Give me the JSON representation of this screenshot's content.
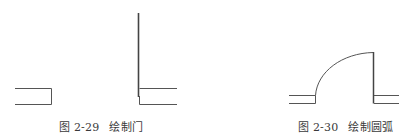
{
  "figures": [
    {
      "id": "left",
      "caption_number": "图 2-29",
      "caption_title": "绘制门",
      "description": "door line drawn between two wall openings"
    },
    {
      "id": "right",
      "caption_number": "图 2-30",
      "caption_title": "绘制圆弧",
      "description": "door with swing arc drawn"
    }
  ],
  "colors": {
    "line": "#555555",
    "door_line": "#444444",
    "caption_text": "#3a3a3a",
    "background": "#ffffff"
  }
}
